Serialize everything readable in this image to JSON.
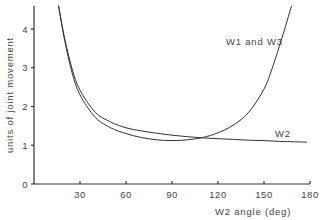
{
  "chart_data": {
    "type": "line",
    "title": "",
    "xlabel": "W2 angle (deg)",
    "ylabel": "units of joint movement",
    "xlim": [
      0,
      180
    ],
    "ylim": [
      0,
      4.6
    ],
    "xticks": [
      30,
      60,
      90,
      120,
      150,
      180
    ],
    "yticks": [
      0,
      1,
      2,
      3,
      4
    ],
    "grid": false,
    "legend": "inline labels",
    "series": [
      {
        "name": "W1 and W3",
        "x": [
          16,
          20,
          25,
          30,
          40,
          50,
          60,
          70,
          80,
          90,
          100,
          110,
          120,
          130,
          140,
          150,
          155,
          160,
          165,
          168
        ],
        "y": [
          4.6,
          3.7,
          2.85,
          2.3,
          1.72,
          1.45,
          1.3,
          1.2,
          1.14,
          1.12,
          1.14,
          1.2,
          1.32,
          1.52,
          1.85,
          2.45,
          2.95,
          3.55,
          4.2,
          4.6
        ]
      },
      {
        "name": "W2",
        "x": [
          16,
          20,
          25,
          30,
          40,
          50,
          60,
          70,
          80,
          90,
          100,
          110,
          120,
          130,
          140,
          150,
          160,
          170,
          178
        ],
        "y": [
          4.6,
          3.75,
          2.95,
          2.42,
          1.85,
          1.6,
          1.45,
          1.37,
          1.31,
          1.26,
          1.22,
          1.19,
          1.17,
          1.15,
          1.13,
          1.12,
          1.1,
          1.09,
          1.08
        ]
      }
    ]
  },
  "labels": {
    "w1w3": "W1 and W3",
    "w2": "W2",
    "xlabel": "W2 angle (deg)",
    "ylabel": "units of joint movement"
  }
}
